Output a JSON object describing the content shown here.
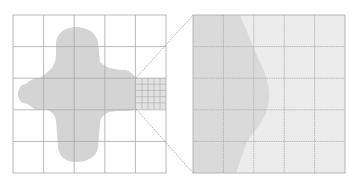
{
  "colors": {
    "background": "#ffffff",
    "grid_line": "#a8a8a8",
    "shape_fill": "#d4d4d4",
    "zoom_panel_bg": "#ececec",
    "zoom_shape_fill": "#dcdcdc",
    "connector": "#9a9a9a"
  },
  "left_grid": {
    "x": 13,
    "y": 15,
    "width": 153,
    "height": 158,
    "rows": 5,
    "cols": 5
  },
  "highlight_cell": {
    "row": 2,
    "col": 4,
    "subdivisions": 5
  },
  "zoom_panel": {
    "x": 193,
    "y": 15,
    "width": 152,
    "height": 158,
    "rows": 5,
    "cols": 5
  }
}
